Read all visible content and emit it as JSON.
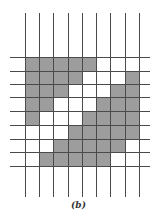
{
  "figure": {
    "caption": "(b)",
    "colors": {
      "filled": "#9d9d9d",
      "line": "#4a4a4a",
      "background": "#ffffff"
    },
    "grid": {
      "rows": 8,
      "cols": 8,
      "x_lines": [
        25,
        39,
        53,
        68,
        82,
        96,
        110,
        125,
        139
      ],
      "y_lines": [
        57,
        71,
        84,
        97,
        111,
        125,
        139,
        152,
        166
      ],
      "v_extent": [
        13,
        197
      ],
      "h_extent": [
        10,
        150
      ],
      "cells": [
        [
          1,
          1,
          1,
          1,
          1,
          0,
          0,
          0
        ],
        [
          1,
          1,
          1,
          1,
          0,
          0,
          0,
          1
        ],
        [
          1,
          1,
          1,
          0,
          0,
          0,
          1,
          1
        ],
        [
          1,
          1,
          0,
          0,
          0,
          1,
          1,
          1
        ],
        [
          1,
          0,
          0,
          0,
          1,
          1,
          1,
          1
        ],
        [
          0,
          0,
          0,
          1,
          1,
          1,
          1,
          1
        ],
        [
          0,
          0,
          1,
          1,
          1,
          1,
          1,
          0
        ],
        [
          0,
          1,
          1,
          1,
          1,
          1,
          0,
          0
        ]
      ]
    }
  }
}
